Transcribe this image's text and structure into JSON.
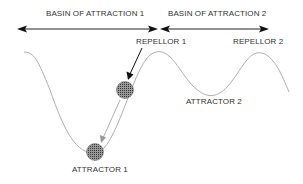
{
  "diagram": {
    "basins": [
      {
        "label": "BASIN OF ATTRACTION 1"
      },
      {
        "label": "BASIN OF ATTRACTION 2"
      }
    ],
    "repellors": [
      {
        "label": "REPELLOR 1"
      },
      {
        "label": "REPELLOR 2"
      }
    ],
    "attractors": [
      {
        "label": "ATTRACTOR 1"
      },
      {
        "label": "ATTRACTOR 2"
      }
    ],
    "colors": {
      "curve": "#b0b0b0",
      "arrow": "#222222",
      "ball": "#555555",
      "text": "#333333"
    }
  }
}
